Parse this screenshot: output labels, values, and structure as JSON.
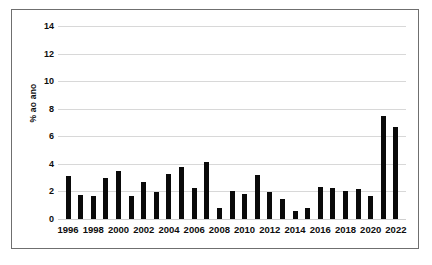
{
  "chart_data": {
    "type": "bar",
    "title": "",
    "xlabel": "",
    "ylabel": "% ao ano",
    "ylim": [
      0,
      14
    ],
    "yticks": [
      0,
      2,
      4,
      6,
      8,
      10,
      12,
      14
    ],
    "ytick_labels": [
      "0",
      "2",
      "4",
      "6",
      "8",
      "10",
      "12",
      "14"
    ],
    "xtick_labels": [
      "1996",
      "1998",
      "2000",
      "2002",
      "2004",
      "2006",
      "2008",
      "2010",
      "2012",
      "2014",
      "2016",
      "2018",
      "2020",
      "2022"
    ],
    "grid": true,
    "legend": "none",
    "bar_color": "#0a0a0a",
    "grid_color": "#d8d8d8",
    "frame_color": "#6f6f6f",
    "categories": [
      "1996",
      "1997",
      "1998",
      "1999",
      "2000",
      "2001",
      "2002",
      "2003",
      "2004",
      "2005",
      "2006",
      "2007",
      "2008",
      "2009",
      "2010",
      "2011",
      "2012",
      "2013",
      "2014",
      "2015",
      "2016",
      "2017",
      "2018",
      "2019",
      "2020",
      "2021",
      "2022"
    ],
    "values": [
      3.1,
      1.75,
      1.7,
      3.0,
      3.45,
      1.65,
      2.7,
      1.95,
      3.25,
      3.75,
      2.25,
      4.15,
      0.8,
      2.05,
      1.8,
      3.2,
      1.95,
      1.45,
      0.6,
      0.8,
      2.3,
      2.25,
      2.05,
      2.2,
      1.7,
      7.5,
      6.7
    ]
  }
}
